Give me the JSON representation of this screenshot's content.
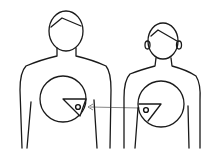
{
  "figure": {
    "description": "Line drawing of two upper-body figures; a wedge section of tissue from the right figure's chest circle is transferred to the left figure's chest circle, indicated by an arrow.",
    "figures": [
      {
        "id": "left",
        "label": "donor-recipient-left",
        "head_style": "short-hair"
      },
      {
        "id": "right",
        "label": "donor-recipient-right",
        "head_style": "hair-with-ears"
      }
    ],
    "arrow": {
      "from": "right",
      "to": "left"
    },
    "colors": {
      "ink": "#1a1a1a",
      "background": "#ffffff"
    }
  }
}
